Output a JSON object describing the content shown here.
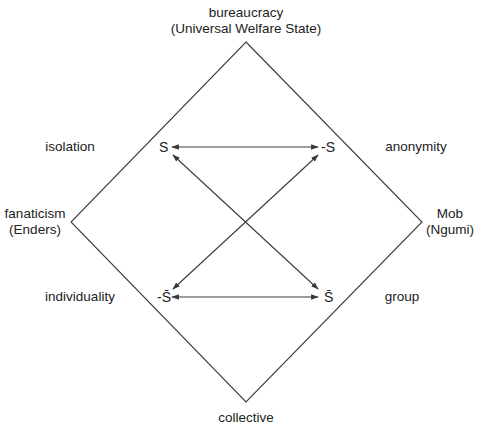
{
  "diagram": {
    "type": "diamond-square-of-opposition",
    "colors": {
      "line": "#3a3a3a",
      "text": "#222222",
      "background": "#ffffff"
    },
    "vertices": {
      "top": {
        "line1": "bureaucracy",
        "line2": "(Universal Welfare State)"
      },
      "left": {
        "line1": "fanaticism",
        "line2": "(Enders)"
      },
      "right": {
        "line1": "Mob",
        "line2": "(Ngumi)"
      },
      "bottom": {
        "line1": "collective"
      }
    },
    "edge_labels": {
      "upper_left": "isolation",
      "upper_right": "anonymity",
      "lower_left": "individuality",
      "lower_right": "group"
    },
    "nodes": {
      "s": "S",
      "neg_s": "-S",
      "neg_s_bar": "-S̄",
      "s_bar": "S̄"
    },
    "relations": [
      {
        "from": "S",
        "to": "-S",
        "type": "bidirectional",
        "orientation": "horizontal"
      },
      {
        "from": "-S̄",
        "to": "S̄",
        "type": "bidirectional",
        "orientation": "horizontal"
      },
      {
        "from": "S",
        "to": "S̄",
        "type": "bidirectional",
        "orientation": "diagonal"
      },
      {
        "from": "-S",
        "to": "-S̄",
        "type": "bidirectional",
        "orientation": "diagonal"
      }
    ]
  }
}
